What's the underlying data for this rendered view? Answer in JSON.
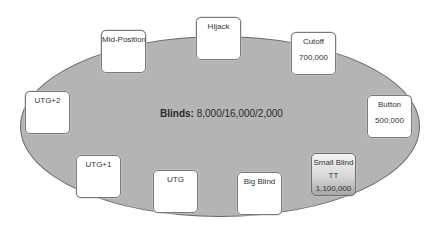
{
  "table": {
    "blinds_label": "Blinds:",
    "blinds_value": "8,000/16,000/2,000",
    "felt_color": "#b4b4b4"
  },
  "seats": {
    "mid_position": {
      "name": "Mid-Position"
    },
    "hijack": {
      "name": "Hijack"
    },
    "cutoff": {
      "name": "Cutoff",
      "stack": "700,000"
    },
    "utg_plus_2": {
      "name": "UTG+2"
    },
    "button": {
      "name": "Button",
      "stack": "500,000"
    },
    "utg_plus_1": {
      "name": "UTG+1"
    },
    "utg": {
      "name": "UTG"
    },
    "big_blind": {
      "name": "Big Blind"
    },
    "small_blind": {
      "name": "Small Blind",
      "hand": "TT",
      "stack": "1,100,000",
      "highlighted": true
    }
  }
}
